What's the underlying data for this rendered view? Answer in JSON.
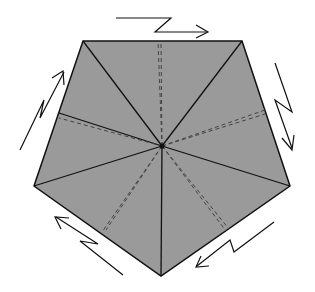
{
  "diagram": {
    "title": "",
    "fill_color": "#999999",
    "line_color": "#111111",
    "dash_color": "#444444",
    "center": [
      162,
      146
    ],
    "vertices": [
      [
        83,
        41
      ],
      [
        242,
        41
      ],
      [
        290,
        186
      ],
      [
        161,
        276
      ],
      [
        34,
        186
      ]
    ],
    "dashed_endpoints": [
      [
        158,
        41
      ],
      [
        265,
        110
      ],
      [
        229,
        229
      ],
      [
        102,
        232
      ],
      [
        59,
        113
      ]
    ],
    "arrows": [
      "top-shear-arrow",
      "right-shear-arrow",
      "bottom-right-shear-arrow",
      "bottom-left-shear-arrow",
      "left-shear-arrow"
    ]
  }
}
